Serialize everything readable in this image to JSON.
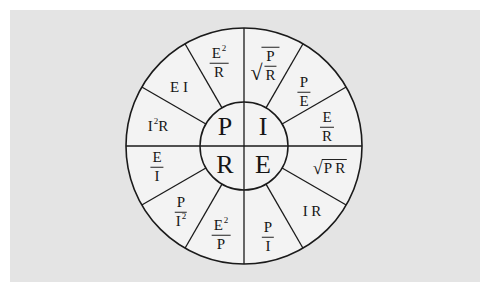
{
  "colors": {
    "background": "#ffffff",
    "panel": "#e4e4e4",
    "wheel_fill": "#f3f3f3",
    "stroke": "#1a1a1a",
    "text": "#151515"
  },
  "geometry": {
    "center_x": 244,
    "center_y": 146,
    "outer_radius": 118,
    "inner_radius": 44,
    "segments": 12
  },
  "center": {
    "top_left": "P",
    "top_right": "I",
    "bottom_left": "R",
    "bottom_right": "E"
  },
  "wedges": {
    "i_sqrt_p_over_r": {
      "quantity": "I",
      "type": "sqrt-fraction",
      "num": "P",
      "den": "R"
    },
    "i_p_over_e": {
      "quantity": "I",
      "type": "fraction",
      "num": "P",
      "den": "E"
    },
    "i_e_over_r": {
      "quantity": "I",
      "type": "fraction",
      "num": "E",
      "den": "R"
    },
    "e_sqrt_pr": {
      "quantity": "E",
      "type": "sqrt",
      "text": "P R"
    },
    "e_ir": {
      "quantity": "E",
      "type": "text",
      "text": "I R"
    },
    "e_p_over_i": {
      "quantity": "E",
      "type": "fraction",
      "num": "P",
      "den": "I"
    },
    "r_e2_over_p": {
      "quantity": "R",
      "type": "fraction",
      "num": "E",
      "num_sup": "2",
      "den": "P"
    },
    "r_p_over_i2": {
      "quantity": "R",
      "type": "fraction",
      "num": "P",
      "den": "I",
      "den_sup": "2"
    },
    "r_e_over_i": {
      "quantity": "R",
      "type": "fraction",
      "num": "E",
      "den": "I"
    },
    "p_i2r": {
      "quantity": "P",
      "type": "text",
      "base": "I",
      "sup": "2",
      "tail": "R"
    },
    "p_ei": {
      "quantity": "P",
      "type": "text",
      "text": "E I"
    },
    "p_e2_over_r": {
      "quantity": "P",
      "type": "fraction",
      "num": "E",
      "num_sup": "2",
      "den": "R"
    }
  }
}
